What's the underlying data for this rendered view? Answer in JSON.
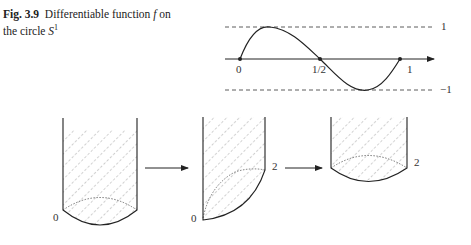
{
  "caption": {
    "figure_number": "Fig. 3.9",
    "text_prefix": "Differentiable function ",
    "var_f": "f",
    "text_mid": " on the circle ",
    "var_S": "S",
    "superscript": "1"
  },
  "graph": {
    "x_labels": [
      "0",
      "1/2",
      "1"
    ],
    "upper_bound_label": "1",
    "lower_bound_label": "−1"
  },
  "shapes": {
    "shape1_label": "0",
    "shape2_label_bottom": "0",
    "shape2_label_right": "2",
    "shape3_label_right": "2"
  }
}
